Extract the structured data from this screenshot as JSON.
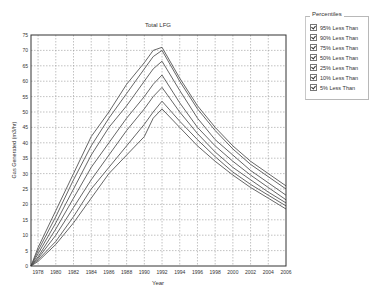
{
  "chart_data": {
    "type": "line",
    "title": "Total LFG",
    "xlabel": "Year",
    "ylabel": "Gas Generated (m3/hr)",
    "xlim": [
      1977.2,
      2006
    ],
    "ylim": [
      0,
      75
    ],
    "x_ticks": [
      1978,
      1980,
      1982,
      1984,
      1986,
      1988,
      1990,
      1992,
      1994,
      1996,
      1998,
      2000,
      2002,
      2004,
      2006
    ],
    "y_ticks": [
      0,
      5,
      10,
      15,
      20,
      25,
      30,
      35,
      40,
      45,
      50,
      55,
      60,
      65,
      70,
      75
    ],
    "grid": true,
    "legend_position": "right",
    "x": [
      1977.2,
      1978,
      1980,
      1982,
      1984,
      1986,
      1988,
      1990,
      1991,
      1992,
      1994,
      1996,
      1998,
      2000,
      2002,
      2004,
      2006
    ],
    "series": [
      {
        "name": "95% Less Than",
        "values": [
          0,
          6,
          18,
          30,
          42,
          50,
          59,
          66,
          70,
          71,
          61,
          52,
          45,
          39,
          34,
          30,
          26
        ]
      },
      {
        "name": "90% Less Than",
        "values": [
          0,
          5,
          16,
          28,
          39,
          48,
          56,
          64,
          68,
          70,
          60,
          51,
          44,
          38,
          33,
          29,
          25
        ]
      },
      {
        "name": "75% Less Than",
        "values": [
          0,
          4,
          14,
          25,
          36,
          45,
          52,
          60,
          64,
          66.5,
          57,
          48,
          41,
          36,
          31,
          27,
          23
        ]
      },
      {
        "name": "50% Less Than",
        "values": [
          0,
          3,
          12,
          22,
          32,
          40,
          48,
          55,
          59,
          62,
          53,
          45,
          39,
          34,
          29.5,
          25.5,
          21.5
        ]
      },
      {
        "name": "25% Less Than",
        "values": [
          0,
          2.5,
          10,
          19,
          28,
          36,
          44,
          51,
          55,
          58,
          50,
          43,
          37,
          32,
          28,
          24,
          20.5
        ]
      },
      {
        "name": "10% Less Than",
        "values": [
          0,
          2,
          8,
          16,
          25,
          32,
          39,
          46,
          50,
          53.5,
          47,
          41,
          35.5,
          30.5,
          26.5,
          23,
          19.5
        ]
      },
      {
        "name": "5% Less Than",
        "values": [
          0,
          1.5,
          7,
          14,
          22,
          30,
          36,
          42,
          48,
          51,
          45,
          39,
          34,
          29.5,
          25.5,
          22,
          18.5
        ]
      }
    ]
  },
  "legend": {
    "title": "Percentiles",
    "items": [
      {
        "label": "95% Less Than",
        "checked": true
      },
      {
        "label": "90% Less Than",
        "checked": true
      },
      {
        "label": "75% Less Than",
        "checked": true
      },
      {
        "label": "50% Less Than",
        "checked": true
      },
      {
        "label": "25% Less Than",
        "checked": true
      },
      {
        "label": "10% Less Than",
        "checked": true
      },
      {
        "label": "5% Less Than",
        "checked": true
      }
    ]
  },
  "colors": {
    "line": "#555555",
    "grid": "#999999",
    "axis": "#333333"
  }
}
